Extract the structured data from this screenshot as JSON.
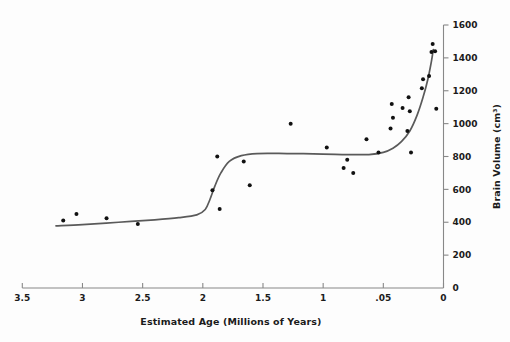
{
  "chart_data": {
    "type": "scatter",
    "title": "",
    "subtitle": "",
    "xlabel": "Estimated Age (Millions of Years)",
    "ylabel": "Brain Volume (cm³)",
    "x_axis": {
      "tick_labels": [
        "3.5",
        "3",
        "2.5",
        "2",
        "1.5",
        "1",
        ".05",
        "0"
      ],
      "tick_values": [
        3.5,
        3.0,
        2.5,
        2.0,
        1.5,
        1.0,
        0.5,
        0.0
      ],
      "direction": "decreasing",
      "xlim": [
        3.5,
        0.0
      ]
    },
    "y_axis": {
      "tick_labels": [
        "0",
        "200",
        "400",
        "600",
        "800",
        "1000",
        "1200",
        "1400",
        "1600"
      ],
      "tick_values": [
        0,
        200,
        400,
        600,
        800,
        1000,
        1200,
        1400,
        1600
      ],
      "ylim": [
        0,
        1600
      ],
      "position": "right"
    },
    "grid": false,
    "legend": "none",
    "series": [
      {
        "name": "Hominin specimens",
        "marker": "dot",
        "color": "#111111",
        "points": [
          {
            "x": 3.16,
            "y": 410
          },
          {
            "x": 3.05,
            "y": 450
          },
          {
            "x": 2.8,
            "y": 425
          },
          {
            "x": 2.54,
            "y": 390
          },
          {
            "x": 1.88,
            "y": 800
          },
          {
            "x": 1.92,
            "y": 595
          },
          {
            "x": 1.86,
            "y": 480
          },
          {
            "x": 1.66,
            "y": 770
          },
          {
            "x": 1.61,
            "y": 625
          },
          {
            "x": 1.27,
            "y": 1000
          },
          {
            "x": 0.97,
            "y": 855
          },
          {
            "x": 0.83,
            "y": 730
          },
          {
            "x": 0.8,
            "y": 780
          },
          {
            "x": 0.75,
            "y": 700
          },
          {
            "x": 0.64,
            "y": 905
          },
          {
            "x": 0.54,
            "y": 825
          },
          {
            "x": 0.44,
            "y": 970
          },
          {
            "x": 0.42,
            "y": 1035
          },
          {
            "x": 0.43,
            "y": 1120
          },
          {
            "x": 0.34,
            "y": 1095
          },
          {
            "x": 0.3,
            "y": 955
          },
          {
            "x": 0.29,
            "y": 1160
          },
          {
            "x": 0.28,
            "y": 1075
          },
          {
            "x": 0.27,
            "y": 825
          },
          {
            "x": 0.18,
            "y": 1215
          },
          {
            "x": 0.17,
            "y": 1270
          },
          {
            "x": 0.12,
            "y": 1290
          },
          {
            "x": 0.09,
            "y": 1485
          },
          {
            "x": 0.1,
            "y": 1435
          },
          {
            "x": 0.07,
            "y": 1440
          },
          {
            "x": 0.06,
            "y": 1090
          }
        ]
      }
    ],
    "trend_line": {
      "name": "Fitted trend",
      "color": "#5a5a5a",
      "description": "Step-wise increasing curve: flat near 390 cm³ until ~2.0 Ma, rises to ~815 cm³ plateau by ~1.6 Ma, then rises steeply after ~0.4 Ma to ~1450 cm³",
      "points": [
        {
          "x": 3.22,
          "y": 378
        },
        {
          "x": 3.0,
          "y": 385
        },
        {
          "x": 2.7,
          "y": 400
        },
        {
          "x": 2.4,
          "y": 415
        },
        {
          "x": 2.2,
          "y": 428
        },
        {
          "x": 2.05,
          "y": 445
        },
        {
          "x": 1.98,
          "y": 478
        },
        {
          "x": 1.94,
          "y": 540
        },
        {
          "x": 1.9,
          "y": 620
        },
        {
          "x": 1.85,
          "y": 700
        },
        {
          "x": 1.78,
          "y": 770
        },
        {
          "x": 1.68,
          "y": 805
        },
        {
          "x": 1.55,
          "y": 818
        },
        {
          "x": 1.3,
          "y": 818
        },
        {
          "x": 1.0,
          "y": 815
        },
        {
          "x": 0.8,
          "y": 812
        },
        {
          "x": 0.62,
          "y": 812
        },
        {
          "x": 0.5,
          "y": 825
        },
        {
          "x": 0.42,
          "y": 850
        },
        {
          "x": 0.35,
          "y": 890
        },
        {
          "x": 0.28,
          "y": 955
        },
        {
          "x": 0.22,
          "y": 1050
        },
        {
          "x": 0.17,
          "y": 1160
        },
        {
          "x": 0.13,
          "y": 1270
        },
        {
          "x": 0.1,
          "y": 1380
        },
        {
          "x": 0.085,
          "y": 1450
        }
      ]
    }
  },
  "geometry": {
    "x_axis_left_px": 22.3,
    "x_axis_right_px": 443.5,
    "y_axis_zero_px": 288,
    "y_axis_top_px": 25
  }
}
